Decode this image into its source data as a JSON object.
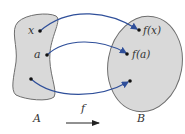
{
  "diagram": {
    "type": "function-mapping",
    "domain_set": {
      "label": "A",
      "elements": [
        {
          "label": "x"
        },
        {
          "label": "a"
        },
        {
          "label": ""
        }
      ]
    },
    "codomain_set": {
      "label": "B",
      "elements": [
        {
          "label": "f(x)"
        },
        {
          "label": "f(a)"
        },
        {
          "label": ""
        }
      ]
    },
    "function_label": "f",
    "colors": {
      "set_fill": "#d9d9d9",
      "set_stroke": "#6e6e6e",
      "arrow": "#2f4f9a",
      "text": "#333333"
    }
  }
}
